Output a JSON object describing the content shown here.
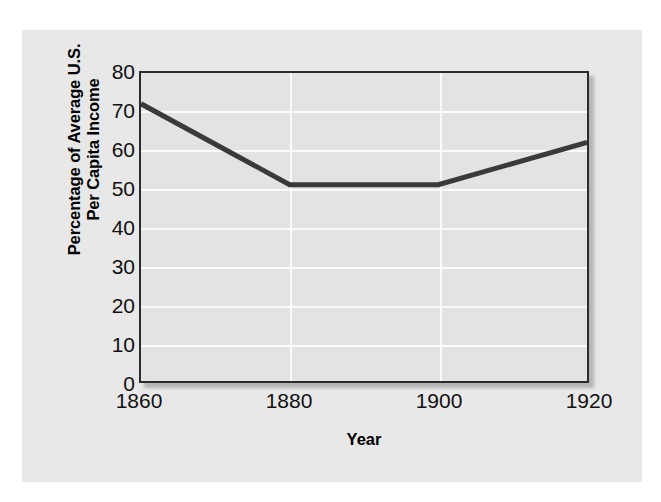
{
  "chart_data": {
    "type": "line",
    "title": "",
    "xlabel": "Year",
    "ylabel": "Percentage of Average U.S. Per Capita Income",
    "ylabel_line1": "Percentage of Average U.S.",
    "ylabel_line2": "Per Capita Income",
    "x": [
      1860,
      1880,
      1900,
      1920
    ],
    "values": [
      72,
      51,
      51,
      62
    ],
    "series": [
      {
        "name": "Percentage of Average U.S. Per Capita Income",
        "values": [
          72,
          51,
          51,
          62
        ]
      }
    ],
    "xlim": [
      1860,
      1920
    ],
    "ylim": [
      0,
      80
    ],
    "xticks": [
      "1860",
      "1880",
      "1900",
      "1920"
    ],
    "yticks": [
      "0",
      "10",
      "20",
      "30",
      "40",
      "50",
      "60",
      "70",
      "80"
    ],
    "ytick_values": [
      0,
      10,
      20,
      30,
      40,
      50,
      60,
      70,
      80
    ],
    "xtick_values": [
      1860,
      1880,
      1900,
      1920
    ],
    "grid": "horizontal-and-vertical",
    "legend": "none",
    "line_color": "#3a3a3a",
    "plot_background": "#e3e3e3",
    "figure_background": "#e8e8e8",
    "grid_color": "#fbfbfb",
    "axis_color": "#2b2b2b"
  }
}
